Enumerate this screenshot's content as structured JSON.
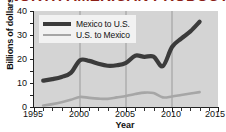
{
  "chart_data": {
    "type": "line",
    "title": "NORTH AMERICAN PRODUCTION",
    "xlabel": "Year",
    "ylabel": "Billions of dollars",
    "xlim": [
      1995,
      2015
    ],
    "ylim": [
      0,
      40
    ],
    "xticks": [
      1995,
      2000,
      2005,
      2010,
      2015
    ],
    "yticks": [
      0,
      10,
      20,
      30,
      40
    ],
    "grid": "vertical gridlines at 2000, 2005, 2010",
    "legend_position": "top-left inside plot",
    "x": [
      1996,
      1997,
      1998,
      1999,
      2000,
      2001,
      2002,
      2003,
      2004,
      2005,
      2006,
      2007,
      2008,
      2009,
      2010,
      2011,
      2012,
      2013
    ],
    "series": [
      {
        "name": "Mexico to U.S.",
        "color": "#3b3b3b",
        "values": [
          11.0,
          11.6,
          12.5,
          14.2,
          19.5,
          19.2,
          18.0,
          17.2,
          17.4,
          18.4,
          21.4,
          20.9,
          21.0,
          17.0,
          25.0,
          28.5,
          31.5,
          35.5
        ]
      },
      {
        "name": "U.S. to Mexico",
        "color": "#a6a6a6",
        "values": [
          0.6,
          1.2,
          2.0,
          3.0,
          4.2,
          3.8,
          3.5,
          3.4,
          4.0,
          4.6,
          5.4,
          6.0,
          5.8,
          4.0,
          4.4,
          5.0,
          5.6,
          6.2
        ]
      }
    ]
  },
  "legend": {
    "items": [
      {
        "label": "Mexico to U.S."
      },
      {
        "label": "U.S. to Mexico"
      }
    ]
  },
  "axes": {
    "y_tick_labels": [
      "40",
      "30",
      "20",
      "10",
      "0"
    ],
    "x_tick_labels": [
      "1995",
      "2000",
      "2005",
      "2010",
      "2015"
    ]
  },
  "colors": {
    "title": "#8c1f16",
    "plot_background": "#d4d4d4",
    "series_1": "#3b3b3b",
    "series_2": "#a6a6a6",
    "axis": "#222222",
    "gridline": "#9a9a9a"
  }
}
